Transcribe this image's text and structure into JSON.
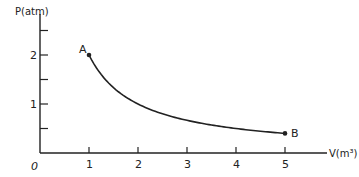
{
  "chart_data": {
    "type": "line",
    "title": "",
    "xlabel": "V(m³)",
    "ylabel": "P(atm)",
    "origin_label": "0",
    "xlim": [
      0,
      5.5
    ],
    "ylim": [
      0,
      2.5
    ],
    "x_ticks": [
      1,
      2,
      3,
      4,
      5
    ],
    "x_tick_labels": [
      "1",
      "2",
      "3",
      "4",
      "5"
    ],
    "y_ticks": [
      0.5,
      1,
      1.5,
      2,
      2.5
    ],
    "y_tick_labels": [
      "",
      "1",
      "",
      "2",
      ""
    ],
    "grid": false,
    "legend": null,
    "series": [
      {
        "name": "A to B (PV = 2)",
        "x": [
          1,
          1.5,
          2,
          2.5,
          3,
          3.5,
          4,
          4.5,
          5
        ],
        "y": [
          2.0,
          1.333,
          1.0,
          0.8,
          0.667,
          0.571,
          0.5,
          0.444,
          0.4
        ]
      }
    ],
    "points": [
      {
        "label": "A",
        "x": 1,
        "y": 2
      },
      {
        "label": "B",
        "x": 5,
        "y": 0.4
      }
    ]
  }
}
